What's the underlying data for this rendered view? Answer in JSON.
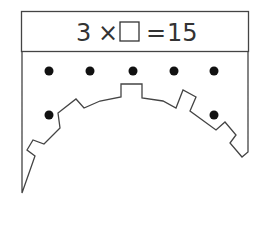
{
  "equation": {
    "left_operand": "3",
    "operator": "×",
    "blank": "□",
    "equals": "=",
    "result": "15",
    "full_text": "3 × □ = 15"
  },
  "figure": {
    "dots_top_row_count": 5,
    "dots_side_count": 2,
    "total_dots": 7
  },
  "colors": {
    "line": "#444444",
    "dot": "#111111",
    "background": "#ffffff"
  }
}
